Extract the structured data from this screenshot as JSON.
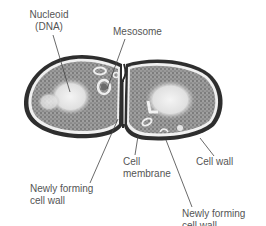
{
  "diagram": {
    "colors": {
      "label_text": "#555555",
      "leader_line": "#444444",
      "cytoplasm": "#8a8a8a",
      "nucleoid": "#e8e8e8",
      "wall": "#3a3a3a",
      "background": "#ffffff"
    },
    "labels": {
      "nucleoid": {
        "line1": "Nucleoid",
        "line2": "(DNA)"
      },
      "mesosome": {
        "line1": "Mesosome"
      },
      "cell_membrane": {
        "line1": "Cell",
        "line2": "membrane"
      },
      "cell_wall": {
        "line1": "Cell wall"
      },
      "newly_forming_left": {
        "line1": "Newly forming",
        "line2": "cell wall"
      },
      "newly_forming_right": {
        "line1": "Newly forming",
        "line2": "cell wall"
      }
    }
  }
}
